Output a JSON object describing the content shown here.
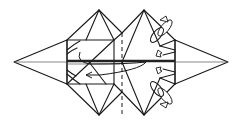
{
  "diagram": {
    "type": "origami-fold-step",
    "colors": {
      "line": "#1a1a1a",
      "background": "#ffffff"
    },
    "elements": [
      {
        "name": "left-point-flap",
        "kind": "triangle"
      },
      {
        "name": "right-point-flap",
        "kind": "triangle"
      },
      {
        "name": "left-square-section",
        "kind": "rectangle"
      },
      {
        "name": "right-diamond-section",
        "kind": "diamond"
      },
      {
        "name": "center-valley-fold-line",
        "kind": "dashed-line"
      },
      {
        "name": "fold-over-arrow",
        "kind": "curved-arrow",
        "direction": "left"
      },
      {
        "name": "upper-rotate-arrow",
        "kind": "rotate-arrow"
      },
      {
        "name": "lower-rotate-arrow",
        "kind": "rotate-arrow"
      },
      {
        "name": "upper-push-arrow",
        "kind": "small-hollow-arrow"
      },
      {
        "name": "lower-push-arrow",
        "kind": "small-hollow-arrow"
      }
    ]
  }
}
